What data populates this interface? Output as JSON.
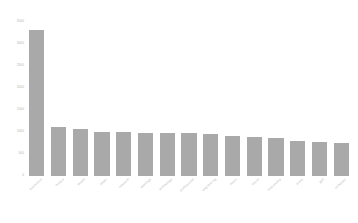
{
  "chart_data": {
    "type": "bar",
    "title": "",
    "subtitle": "",
    "xlabel": "",
    "ylabel": "",
    "grid": false,
    "legend": null,
    "bar_color": "#a9a9a9",
    "background": "#ffffff",
    "ylim": [
      0,
      3500
    ],
    "yticks": [
      0,
      500,
      1000,
      1500,
      2000,
      2500,
      3000,
      3500
    ],
    "ytick_labels": [
      "0",
      "500",
      "1000",
      "1500",
      "2000",
      "2500",
      "3000",
      "3500"
    ],
    "categories": [
      "economics",
      "history",
      "health",
      "paper",
      "research",
      "meetings",
      "technology",
      "professional",
      "engineering",
      "music",
      "social",
      "relationship",
      "piano",
      "golf",
      "computer"
    ],
    "values": [
      3320,
      1120,
      1060,
      1010,
      990,
      980,
      975,
      970,
      965,
      900,
      890,
      870,
      800,
      770,
      740
    ]
  }
}
